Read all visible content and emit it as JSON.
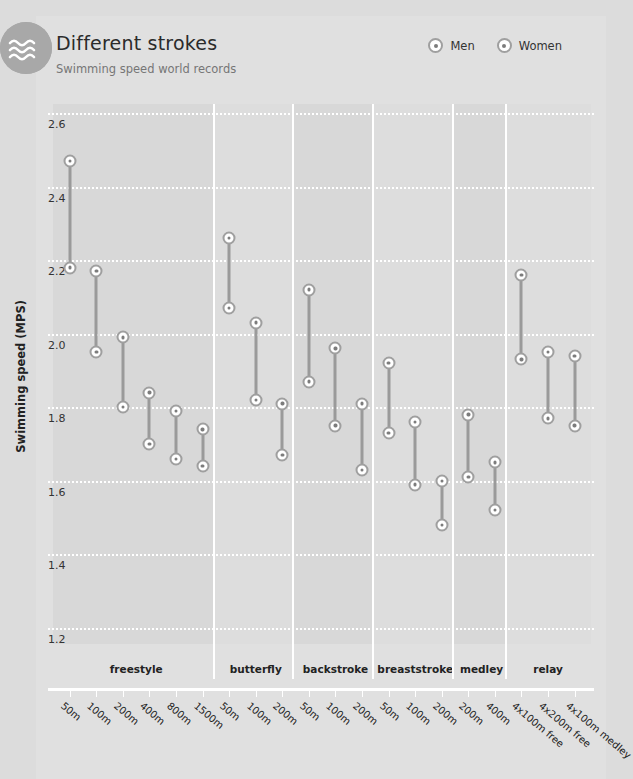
{
  "header": {
    "title": "Different strokes",
    "subtitle": "Swimming speed world records",
    "logo_icon": "waves-icon"
  },
  "legend": {
    "position": "top-right",
    "items": [
      {
        "label": "Men",
        "icon": "circle-dot-marker"
      },
      {
        "label": "Women",
        "icon": "circle-dot-marker"
      }
    ]
  },
  "chart_data": {
    "type": "scatter",
    "title": "Different strokes",
    "subtitle": "Swimming speed world records",
    "xlabel": "",
    "ylabel": "Swimming speed (MPS)",
    "ylim": [
      1.1,
      2.65
    ],
    "yticks": [
      "2.6",
      "2.4",
      "2.2",
      "2.0",
      "1.8",
      "1.6",
      "1.4",
      "1.2"
    ],
    "ytick_values": [
      2.6,
      2.4,
      2.2,
      2.0,
      1.8,
      1.6,
      1.4,
      1.2
    ],
    "grid": "horizontal-dotted-white",
    "legend_position": "top-right",
    "series": [
      {
        "name": "Men",
        "marker": "circle-dot"
      },
      {
        "name": "Women",
        "marker": "circle-dot"
      }
    ],
    "groups": [
      {
        "label": "freestyle",
        "events": [
          {
            "x": "50m",
            "men": 2.47,
            "women": 2.18
          },
          {
            "x": "100m",
            "men": 2.17,
            "women": 1.95
          },
          {
            "x": "200m",
            "men": 1.99,
            "women": 1.8
          },
          {
            "x": "400m",
            "men": 1.84,
            "women": 1.7
          },
          {
            "x": "800m",
            "men": 1.79,
            "women": 1.66
          },
          {
            "x": "1500m",
            "men": 1.74,
            "women": 1.64
          }
        ]
      },
      {
        "label": "butterfly",
        "events": [
          {
            "x": "50m",
            "men": 2.26,
            "women": 2.07
          },
          {
            "x": "100m",
            "men": 2.03,
            "women": 1.82
          },
          {
            "x": "200m",
            "men": 1.81,
            "women": 1.67
          }
        ]
      },
      {
        "label": "backstroke",
        "events": [
          {
            "x": "50m",
            "men": 2.12,
            "women": 1.87
          },
          {
            "x": "100m",
            "men": 1.96,
            "women": 1.75
          },
          {
            "x": "200m",
            "men": 1.81,
            "women": 1.63
          }
        ]
      },
      {
        "label": "breaststroke",
        "events": [
          {
            "x": "50m",
            "men": 1.92,
            "women": 1.73
          },
          {
            "x": "100m",
            "men": 1.76,
            "women": 1.59
          },
          {
            "x": "200m",
            "men": 1.6,
            "women": 1.48
          }
        ]
      },
      {
        "label": "medley",
        "events": [
          {
            "x": "200m",
            "men": 1.78,
            "women": 1.61
          },
          {
            "x": "400m",
            "men": 1.65,
            "women": 1.52
          }
        ]
      },
      {
        "label": "relay",
        "events": [
          {
            "x": "4x100m free",
            "men": 2.16,
            "women": 1.93
          },
          {
            "x": "4x200m free",
            "men": 1.95,
            "women": 1.77
          },
          {
            "x": "4x100m medley",
            "men": 1.94,
            "women": 1.75
          }
        ]
      }
    ]
  },
  "colors": {
    "page_background": "#dcdcdc",
    "card_background": "#e0e0e0",
    "band": "#d8d8d8",
    "gridline": "#ffffff",
    "marker_ring": "#9f9f9f",
    "marker_center": "#7c7c7c",
    "connector": "#9a9a9a",
    "logo": "#a8a8a8",
    "title_text": "#2b2b2b",
    "subtitle_text": "#767676"
  }
}
